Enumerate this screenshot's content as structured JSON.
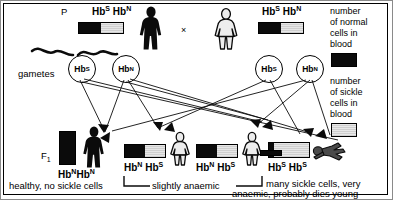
{
  "diagram": {
    "title_row": {
      "p_label": "P",
      "cross_symbol": "×",
      "father_genotype": "HbS HbN",
      "mother_genotype": "HbS HbN"
    },
    "gametes_label": "gametes",
    "f1_label": "F1",
    "father_gametes": [
      "HbS",
      "HbN"
    ],
    "mother_gametes": [
      "HbS",
      "HbN"
    ],
    "legend": {
      "normal_text": "number\nof normal\ncells in\nblood",
      "normal_line1": "number",
      "normal_line2": "of normal",
      "normal_line3": "cells in",
      "normal_line4": "blood",
      "sickle_line1": "number",
      "sickle_line2": "of sickle",
      "sickle_line3": "cells in",
      "sickle_line4": "blood",
      "normal_swatch_color": "#0b0b0b",
      "sickle_swatch_color": "#dcdcdc"
    },
    "offspring": [
      {
        "genotype": "HbNHbN",
        "normal_pct": 100,
        "sickle_pct": 0,
        "figure": "standing-adult-solid"
      },
      {
        "genotype": "HbN HbS",
        "normal_pct": 50,
        "sickle_pct": 50,
        "figure": "standing-child-outline"
      },
      {
        "genotype": "HbN HbS",
        "normal_pct": 50,
        "sickle_pct": 50,
        "figure": "standing-child-outline"
      },
      {
        "genotype": "HbS HbS",
        "normal_pct": 12,
        "sickle_pct": 88,
        "figure": "collapsed-person"
      }
    ],
    "captions": {
      "healthy": "healthy, no sickle cells",
      "slightly": "slightly anaemic",
      "severe_line1": "many sickle cells, very",
      "severe_line2": "anaemic, probably dies young"
    },
    "parents": {
      "father_bar": {
        "normal_pct": 50,
        "sickle_pct": 50
      },
      "mother_bar": {
        "normal_pct": 50,
        "sickle_pct": 50
      }
    }
  }
}
